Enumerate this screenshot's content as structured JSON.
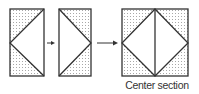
{
  "diagram": {
    "steps": [
      {
        "id": "step-1",
        "shape": "rectangle",
        "description": "Triangle pointing left from right edge, top-left and bottom-left corners shaded"
      },
      {
        "id": "step-2",
        "shape": "rectangle",
        "description": "Triangle pointing right from left edge, top-right and bottom-right corners shaded"
      },
      {
        "id": "step-3",
        "shape": "square",
        "description": "Two halves joined forming a diamond with vertical center line; four corners shaded"
      }
    ],
    "arrows": [
      {
        "from": "step-1",
        "to": "step-2"
      },
      {
        "from": "step-2",
        "to": "step-3"
      }
    ],
    "caption": "Center section"
  },
  "colors": {
    "stroke": "#333333",
    "shade_dots": "#9a9a9a",
    "background": "#ffffff"
  }
}
